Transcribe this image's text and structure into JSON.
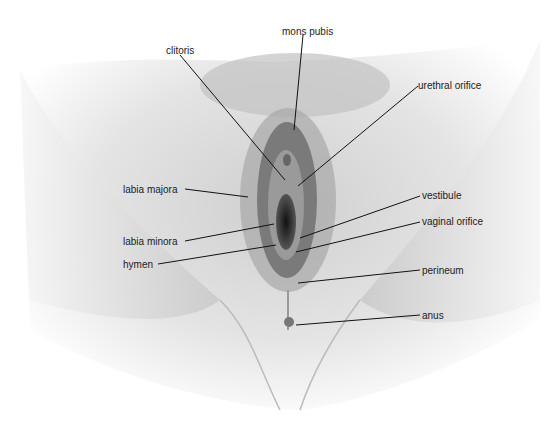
{
  "diagram": {
    "type": "anatomical-illustration",
    "style": "grayscale-drawing",
    "labels": [
      {
        "id": "mons-pubis",
        "text": "mons pubis",
        "x": 282,
        "y": 26
      },
      {
        "id": "clitoris",
        "text": "clitoris",
        "x": 166,
        "y": 45
      },
      {
        "id": "urethral-orifice",
        "text": "urethral orifice",
        "x": 418,
        "y": 80
      },
      {
        "id": "labia-majora",
        "text": "labia majora",
        "x": 123,
        "y": 184
      },
      {
        "id": "vestibule",
        "text": "vestibule",
        "x": 422,
        "y": 190
      },
      {
        "id": "vaginal-orifice",
        "text": "vaginal orifice",
        "x": 422,
        "y": 216
      },
      {
        "id": "labia-minora",
        "text": "labia minora",
        "x": 123,
        "y": 236
      },
      {
        "id": "hymen",
        "text": "hymen",
        "x": 123,
        "y": 259
      },
      {
        "id": "perineum",
        "text": "perineum",
        "x": 422,
        "y": 265
      },
      {
        "id": "anus",
        "text": "anus",
        "x": 422,
        "y": 310
      }
    ]
  }
}
